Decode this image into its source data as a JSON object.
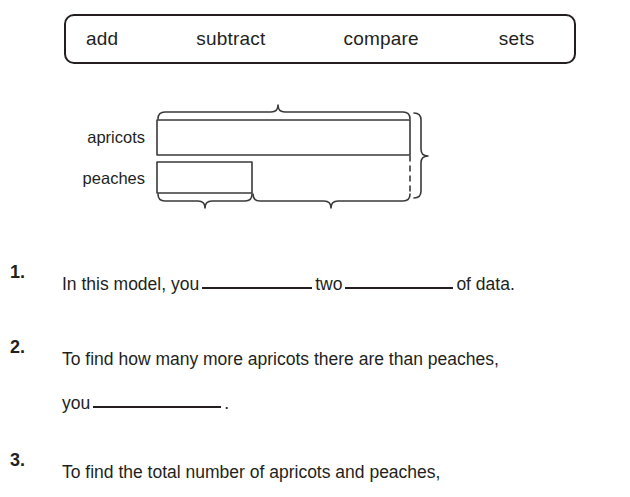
{
  "page": {
    "background_color": "#ffffff",
    "ink_color": "#231f20"
  },
  "word_bank": {
    "name": "word-bank",
    "words": [
      {
        "label": "add"
      },
      {
        "label": "subtract"
      },
      {
        "label": "compare"
      },
      {
        "label": "sets"
      }
    ]
  },
  "bar_model": {
    "name": "bar-model",
    "labels": {
      "top_bar": "apricots",
      "bottom_bar": "peaches"
    },
    "bars": [
      {
        "name": "apricots-bar",
        "label": "apricots",
        "relative_length": 1.0
      },
      {
        "name": "peaches-bar",
        "label": "peaches",
        "relative_length": 0.375
      }
    ],
    "braces": {
      "top": "total-apricots-brace",
      "bottom_left": "peaches-amount-brace",
      "bottom_right": "difference-brace",
      "right": "total-combined-brace"
    },
    "dashed_guide": "alignment-dashed-line"
  },
  "questions": [
    {
      "number": "1.",
      "line1_part1": "In this model, you",
      "line1_part2": "two",
      "line1_part3": "of data.",
      "blanks": 2
    },
    {
      "number": "2.",
      "line1": "To find how many more apricots there are than peaches,",
      "line2_part1": "you",
      "line2_part2": ".",
      "blanks": 1
    },
    {
      "number": "3.",
      "line1": "To find the total number of apricots and peaches,",
      "blanks": 0
    }
  ]
}
